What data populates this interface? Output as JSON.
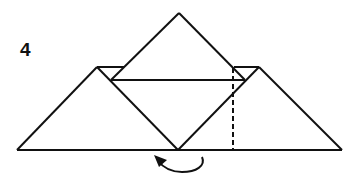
{
  "diagram": {
    "step_number": "4",
    "colors": {
      "line": "#111111",
      "background": "#ffffff"
    },
    "elements": [
      {
        "name": "top-diamond",
        "type": "solid-lines"
      },
      {
        "name": "left-triangle",
        "type": "solid-lines"
      },
      {
        "name": "right-triangle",
        "type": "solid-lines"
      },
      {
        "name": "inner-horizontal-fold",
        "type": "solid-line"
      },
      {
        "name": "base-line",
        "type": "solid-line"
      },
      {
        "name": "valley-fold-line",
        "type": "dashed-line"
      },
      {
        "name": "turn-arrow",
        "type": "curved-arrow"
      }
    ]
  }
}
